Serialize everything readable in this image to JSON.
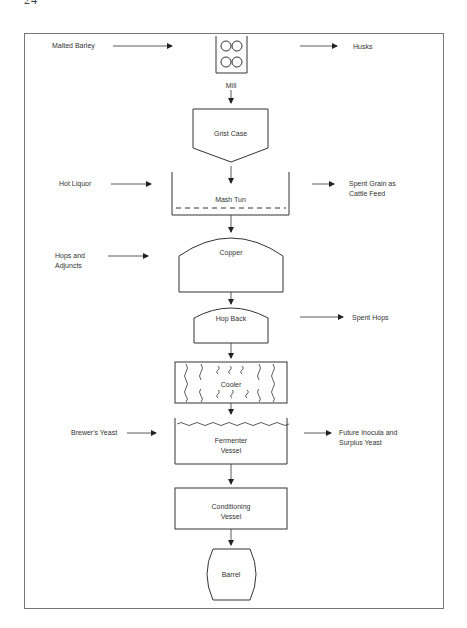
{
  "page": {
    "number": "24",
    "running_title": "BREWING IN ... (clipped)"
  },
  "diagram": {
    "stages": [
      {
        "id": "mill",
        "label": "Mill"
      },
      {
        "id": "grist_case",
        "label": "Grist Case"
      },
      {
        "id": "mash_tun",
        "label": "Mash Tun"
      },
      {
        "id": "copper",
        "label": "Copper"
      },
      {
        "id": "hop_back",
        "label": "Hop Back"
      },
      {
        "id": "cooler",
        "label": "Cooler"
      },
      {
        "id": "fermenter",
        "label_line1": "Fermenter",
        "label_line2": "Vessel"
      },
      {
        "id": "conditioning",
        "label_line1": "Conditioning",
        "label_line2": "Vessel"
      },
      {
        "id": "barrel",
        "label": "Barrel"
      }
    ],
    "inputs": [
      {
        "to": "mill",
        "label": "Malted Barley"
      },
      {
        "to": "mash_tun",
        "label": "Hot Liquor"
      },
      {
        "to": "copper",
        "label_line1": "Hops and",
        "label_line2": "Adjuncts"
      },
      {
        "to": "fermenter",
        "label": "Brewer's Yeast"
      }
    ],
    "outputs": [
      {
        "from": "mill",
        "label": "Husks"
      },
      {
        "from": "mash_tun",
        "label_line1": "Spent Grain as",
        "label_line2": "Cattle Feed"
      },
      {
        "from": "hop_back",
        "label": "Spent Hops"
      },
      {
        "from": "fermenter",
        "label_line1": "Future Inocula and",
        "label_line2": "Surplus Yeast"
      }
    ]
  }
}
